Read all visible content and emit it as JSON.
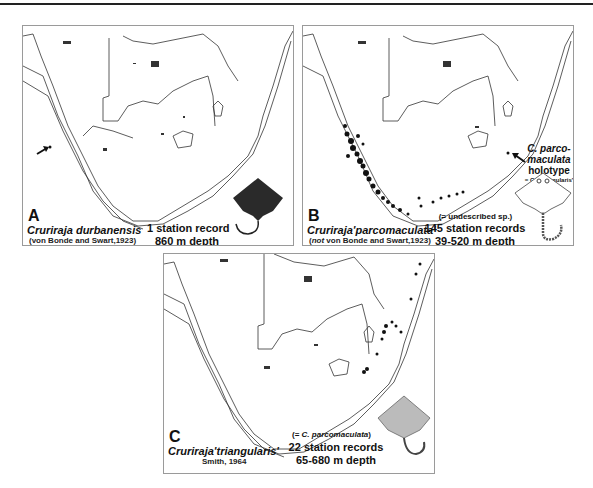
{
  "figure": {
    "panels": [
      {
        "letter": "A",
        "species": "Cruriraja durbanensis",
        "authority": "(von Bonde and Swart,1923)",
        "records": "1 station record",
        "depth": "860 m depth",
        "arrow_label": ""
      },
      {
        "letter": "B",
        "species": "Cruriraja'parcomaculata'",
        "authority_prefix": "(",
        "authority_not": "not",
        "authority_rest": " von Bonde and Swart,1923)",
        "note": "(= undescribed sp.)",
        "records": "145 station records",
        "depth": "39-520 m depth",
        "holotype": {
          "line1": "C. parco-",
          "line2": "maculata",
          "line3": "holotype",
          "line4": "= C. 'triangularis'"
        }
      },
      {
        "letter": "C",
        "species": "Cruriraja'triangularis'",
        "authority": "Smith, 1964",
        "note_prefix": "(= ",
        "note_italic": "C. parcomaculata",
        "note_suffix": ")",
        "records": "22 station records",
        "depth": "65-680 m depth"
      }
    ]
  }
}
